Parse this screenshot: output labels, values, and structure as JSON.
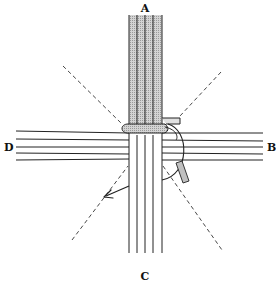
{
  "figure": {
    "type": "weaving-diagram",
    "labels": {
      "top": "A",
      "right": "B",
      "bottom": "C",
      "left": "D"
    },
    "colors": {
      "line": "#222222",
      "shade": "#c8c8c8",
      "background": "#ffffff"
    }
  }
}
